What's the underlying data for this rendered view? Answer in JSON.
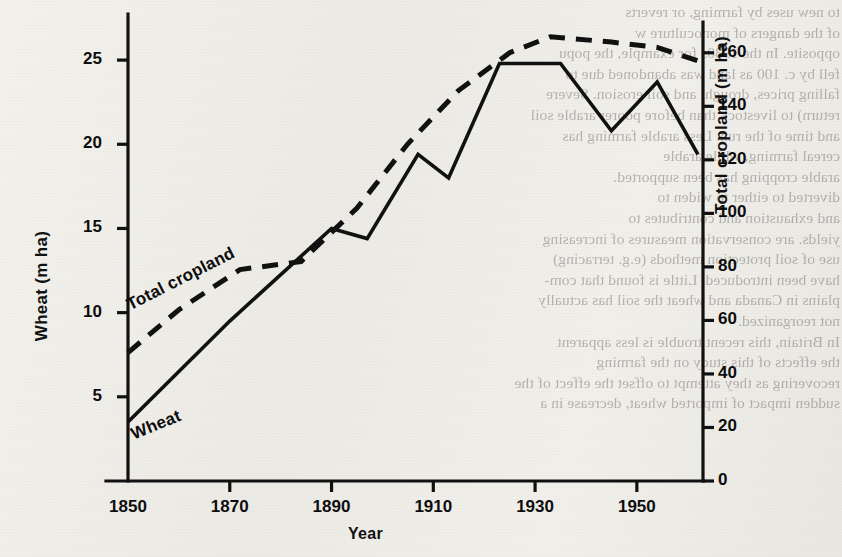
{
  "chart_data": {
    "type": "line",
    "title": "",
    "xlabel": "Year",
    "ylabel_left": "Wheat (m ha)",
    "ylabel_right": "Total cropland (m ha)",
    "xlim": [
      1850,
      1963
    ],
    "ylim_left": [
      0,
      27.5
    ],
    "ylim_right": [
      0,
      173
    ],
    "grid": false,
    "legend_position": "inline-on-curve",
    "xticks": [
      1850,
      1870,
      1890,
      1910,
      1930,
      1950
    ],
    "xtick_labels": [
      "1850",
      "1870",
      "1890",
      "1910",
      "1930",
      "1950"
    ],
    "yticks_left": [
      5,
      10,
      15,
      20,
      25
    ],
    "ytick_labels_left": [
      "5",
      "10",
      "15",
      "20",
      "25"
    ],
    "yticks_right": [
      0,
      20,
      40,
      60,
      80,
      100,
      120,
      140,
      160
    ],
    "ytick_labels_right": [
      "0",
      "20",
      "40",
      "60",
      "80",
      "100",
      "120",
      "140",
      "160"
    ],
    "series": [
      {
        "name": "Wheat",
        "axis": "left",
        "style": "solid",
        "color": "#111111",
        "points": [
          [
            1850,
            3.5
          ],
          [
            1870,
            9.5
          ],
          [
            1890,
            15.0
          ],
          [
            1897,
            14.4
          ],
          [
            1907,
            19.4
          ],
          [
            1913,
            18.0
          ],
          [
            1923,
            24.8
          ],
          [
            1935,
            24.8
          ],
          [
            1945,
            20.8
          ],
          [
            1954,
            23.7
          ],
          [
            1962,
            19.4
          ]
        ]
      },
      {
        "name": "Total cropland",
        "axis": "right",
        "style": "dashed",
        "color": "#111111",
        "points": [
          [
            1850,
            48
          ],
          [
            1860,
            64
          ],
          [
            1872,
            79
          ],
          [
            1884,
            82
          ],
          [
            1895,
            102
          ],
          [
            1905,
            126
          ],
          [
            1915,
            146
          ],
          [
            1925,
            160
          ],
          [
            1933,
            166
          ],
          [
            1945,
            164
          ],
          [
            1954,
            162
          ],
          [
            1962,
            157
          ]
        ]
      }
    ],
    "annotations": [
      {
        "text": "Total cropland",
        "series": "Total cropland",
        "rotation": -27
      },
      {
        "text": "Wheat",
        "series": "Wheat",
        "rotation": -22
      }
    ]
  },
  "page_text": {
    "right_column": "to new uses by farming, or reverts\nof the dangers of monoculture w\nopposite. In the 1930s for example, the popu\nfell by c. 100 as land was abandoned due to\nfalling prices, drought and soil erosion. Severe\nreturn) to livestock than before poorer arable soil\nand time of the run. Less arable farming has\ncereal farming, while arable\narable cropping has been supported.\ndiverted to either to widen to\nand exhaustion and contributes to\nyields. are conservation measures of increasing\nuse of soil protection methods (e.g. terracing)\nhave been introduced. Little is found that com-\nplains in Canada and wheat the soil has actually\nnot reorganized.\nIn Britain, this recent trouble is less apparent\nthe effects of this study on the farming\nrecovering as they attempt to offset the effect of the\nsudden impact of imported wheat, decrease in a",
    "left_column": "Wheat"
  }
}
